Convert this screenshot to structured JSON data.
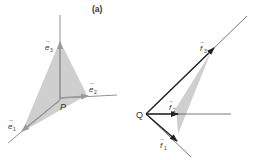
{
  "figure": {
    "panel_label": "(a)",
    "left": {
      "origin_label": "P",
      "vectors": [
        {
          "name": "e1",
          "label": "e",
          "sub": "1"
        },
        {
          "name": "e2",
          "label": "e",
          "sub": "2"
        },
        {
          "name": "e3",
          "label": "e",
          "sub": "3"
        }
      ]
    },
    "right": {
      "origin_label": "Q",
      "vectors": [
        {
          "name": "f1",
          "label": "f",
          "sub": "1"
        },
        {
          "name": "f2",
          "label": "f",
          "sub": "2"
        },
        {
          "name": "f3",
          "label": "f",
          "sub": "3"
        }
      ]
    },
    "colors": {
      "line": "#555555",
      "arrow": "#333333",
      "shade": "#c8c8c8"
    }
  }
}
